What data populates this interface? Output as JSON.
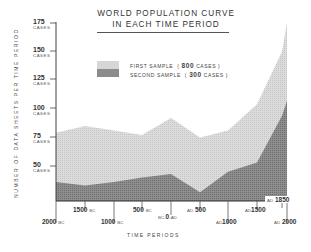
{
  "chart_data": {
    "type": "area",
    "title": "WORLD POPULATION CURVE IN EACH TIME PERIOD",
    "title_lines": [
      "WORLD  POPULATION  CURVE",
      "IN  EACH  TIME  PERIOD"
    ],
    "xlabel": "TIME   PERIODS",
    "ylabel": "NUMBER  OF  DATA  SHEETS  PER  TIME  PERIOD",
    "categories": [
      "2000 BC",
      "1500 BC",
      "1000 BC",
      "500 BC",
      "BC-0-AD",
      "AD 500",
      "AD 1000",
      "AD 1500",
      "AD 1850",
      "AD 2000"
    ],
    "x_ticks": [
      {
        "num": "2000",
        "era": "BC",
        "pre": "",
        "x": 56,
        "row": 2
      },
      {
        "num": "1500",
        "era": "BC",
        "pre": "",
        "x": 85,
        "row": 1
      },
      {
        "num": "1000",
        "era": "BC",
        "pre": "",
        "x": 114,
        "row": 2
      },
      {
        "num": "500",
        "era": "BC",
        "pre": "",
        "x": 142,
        "row": 1
      },
      {
        "num": "0",
        "era": "-AD",
        "pre": "BC-",
        "x": 171,
        "row": 1.5
      },
      {
        "num": "500",
        "era": "",
        "pre": "AD",
        "x": 200,
        "row": 1
      },
      {
        "num": "1000",
        "era": "",
        "pre": "AD",
        "x": 228,
        "row": 2
      },
      {
        "num": "1500",
        "era": "",
        "pre": "AD",
        "x": 257,
        "row": 1
      },
      {
        "num": "1850",
        "era": "",
        "pre": "AD",
        "x": 282,
        "row": 0
      },
      {
        "num": "2000",
        "era": "",
        "pre": "AD",
        "x": 287,
        "row": 2
      }
    ],
    "y_ticks": [
      {
        "value": "175",
        "unit": "CASES"
      },
      {
        "value": "150",
        "unit": "CASES"
      },
      {
        "value": "125",
        "unit": "CASES"
      },
      {
        "value": "100",
        "unit": "CASES"
      },
      {
        "value": "75",
        "unit": "CASES"
      },
      {
        "value": "50",
        "unit": "CASES"
      }
    ],
    "ylim": [
      20,
      175
    ],
    "grid": false,
    "legend_position": "upper-left inside plot",
    "series": [
      {
        "name": "FIRST SAMPLE ( 800 CASES )",
        "label_text": "FIRST SAMPLE",
        "count": "800",
        "color": "#d4d4d4",
        "values": [
          79,
          85,
          81,
          77,
          92,
          75,
          81,
          104,
          150,
          175
        ]
      },
      {
        "name": "SECOND SAMPLE ( 300 CASES )",
        "label_text": "SECOND SAMPLE",
        "count": "300",
        "color": "#8a8a8a",
        "values": [
          36,
          33,
          36,
          40,
          43,
          27,
          45,
          53,
          94,
          107
        ]
      }
    ]
  },
  "legend": {
    "first": {
      "label": "FIRST SAMPLE",
      "open": "(",
      "count": "800",
      "unit": "CASES )"
    },
    "second": {
      "label": "SECOND SAMPLE",
      "open": "(",
      "count": "300",
      "unit": "CASES )"
    }
  },
  "labels": {
    "title_line1": "WORLD  POPULATION  CURVE",
    "title_line2": "IN  EACH  TIME  PERIOD",
    "ylabel": "NUMBER  OF  DATA  SHEETS  PER  TIME  PERIOD",
    "xlabel": "TIME   PERIODS",
    "y175": "175",
    "y150": "150",
    "y125": "125",
    "y100": "100",
    "y75": "75",
    "y50": "50",
    "cases": "CASES",
    "x": {
      "bc2000": "2000",
      "bc1500": "1500",
      "bc1000": "1000",
      "bc500": "500",
      "zero": "0",
      "bc_prefix": "BC-",
      "ad_suffix": "-AD",
      "ad500": "500",
      "ad1000": "1000",
      "ad1500": "1500",
      "ad1850": "1850",
      "ad2000": "2000",
      "bc": "BC",
      "ad": "AD"
    }
  }
}
